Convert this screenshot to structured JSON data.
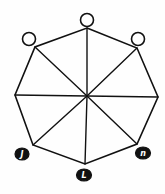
{
  "diagram": {
    "type": "octagon-wheel-graph",
    "colors": {
      "line": "#111111",
      "open_node_fill": "#ffffff",
      "filled_node_fill": "#111111",
      "background": "#fefefe"
    },
    "center": {
      "x": 87,
      "y": 96
    },
    "vertices": [
      {
        "id": "top",
        "x": 87,
        "y": 28
      },
      {
        "id": "top-right",
        "x": 137,
        "y": 48
      },
      {
        "id": "right",
        "x": 158,
        "y": 97
      },
      {
        "id": "bottom-right",
        "x": 137,
        "y": 144
      },
      {
        "id": "bottom",
        "x": 85,
        "y": 164
      },
      {
        "id": "bottom-left",
        "x": 33,
        "y": 145
      },
      {
        "id": "left",
        "x": 15,
        "y": 95
      },
      {
        "id": "top-left",
        "x": 35,
        "y": 47
      }
    ],
    "nodes": [
      {
        "id": "node-top",
        "kind": "open",
        "cx": 87,
        "cy": 20,
        "rx": 6.5,
        "ry": 6.5,
        "label": ""
      },
      {
        "id": "node-top-left",
        "kind": "open",
        "cx": 29,
        "cy": 39,
        "rx": 6.5,
        "ry": 6.5,
        "label": ""
      },
      {
        "id": "node-top-right",
        "kind": "open",
        "cx": 138,
        "cy": 39,
        "rx": 6.5,
        "ry": 6.5,
        "label": ""
      },
      {
        "id": "node-bottom-left",
        "kind": "filled",
        "cx": 22,
        "cy": 154,
        "rx": 7,
        "ry": 6,
        "label": "J"
      },
      {
        "id": "node-bottom",
        "kind": "filled",
        "cx": 84,
        "cy": 175,
        "rx": 7.5,
        "ry": 6,
        "label": "L"
      },
      {
        "id": "node-bottom-right",
        "kind": "filled",
        "cx": 143,
        "cy": 153,
        "rx": 7.5,
        "ry": 6,
        "label": "n"
      }
    ]
  }
}
